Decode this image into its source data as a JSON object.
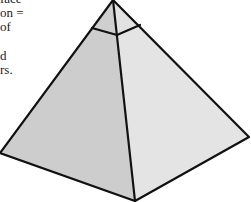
{
  "text_fragment": {
    "lines": [
      "face",
      "on =",
      "of",
      "",
      "d",
      "rs."
    ]
  },
  "figure": {
    "type": "square-pyramid-with-cap",
    "colors": {
      "left_face": "#cdcdcd",
      "right_face": "#e4e4e4",
      "cap_left": "#cfcfcf",
      "cap_right": "#e2e2e2",
      "edge": "#111111",
      "background": "#ffffff"
    }
  }
}
